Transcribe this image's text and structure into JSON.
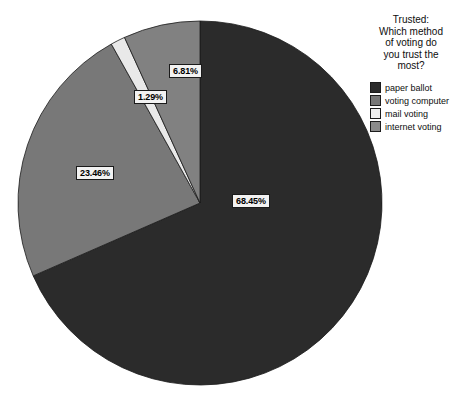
{
  "chart_data": {
    "type": "pie",
    "title": "Trusted: Which method of voting do you trust the most?",
    "categories": [
      "paper ballot",
      "voting computer",
      "mail voting",
      "internet voting"
    ],
    "values": [
      68.45,
      23.46,
      1.29,
      6.81
    ],
    "value_labels": [
      "68.45%",
      "23.46%",
      "1.29%",
      "6.81%"
    ],
    "colors": [
      "#2b2b2b",
      "#787878",
      "#e9e9e9",
      "#818181"
    ],
    "unit": "%",
    "start_angle_deg": 0,
    "direction": "clockwise",
    "legend_position": "right",
    "grid": false,
    "xlabel": "",
    "ylabel": ""
  },
  "legend": {
    "title_lines": [
      "Trusted:",
      "Which method",
      "of voting do",
      "you trust the",
      "most?"
    ],
    "items": [
      {
        "label": "paper ballot",
        "color": "#2b2b2b"
      },
      {
        "label": "voting computer",
        "color": "#787878"
      },
      {
        "label": "mail voting",
        "color": "#f0f0f0"
      },
      {
        "label": "internet voting",
        "color": "#8a8a8a"
      }
    ]
  },
  "labels": {
    "paper_ballot": "68.45%",
    "voting_computer": "23.46%",
    "mail_voting": "1.29%",
    "internet_voting": "6.81%"
  }
}
